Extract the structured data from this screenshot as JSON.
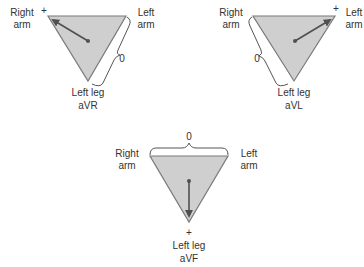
{
  "diagram": {
    "panels": [
      {
        "id": "aVR",
        "lead_label": "aVR",
        "right_arm_label": [
          "Right",
          "arm"
        ],
        "left_arm_label": [
          "Left",
          "arm"
        ],
        "left_leg_label": "Left leg",
        "positive_marker": "+",
        "positive_electrode": "Right arm",
        "zero_marker": "0",
        "zero_side": "Left arm – Left leg"
      },
      {
        "id": "aVL",
        "lead_label": "aVL",
        "right_arm_label": [
          "Right",
          "arm"
        ],
        "left_arm_label": [
          "Left",
          "arm"
        ],
        "left_leg_label": "Left leg",
        "positive_marker": "+",
        "positive_electrode": "Left arm",
        "zero_marker": "0",
        "zero_side": "Right arm – Left leg"
      },
      {
        "id": "aVF",
        "lead_label": "aVF",
        "right_arm_label": [
          "Right",
          "arm"
        ],
        "left_arm_label": [
          "Left",
          "arm"
        ],
        "left_leg_label": "Left leg",
        "positive_marker": "+",
        "positive_electrode": "Left leg",
        "zero_marker": "0",
        "zero_side": "Right arm – Left arm"
      }
    ],
    "colors": {
      "triangle_fill": "#cfcfcf",
      "triangle_stroke": "#7a7a7a",
      "vector": "#505050",
      "text": "#333333"
    }
  }
}
